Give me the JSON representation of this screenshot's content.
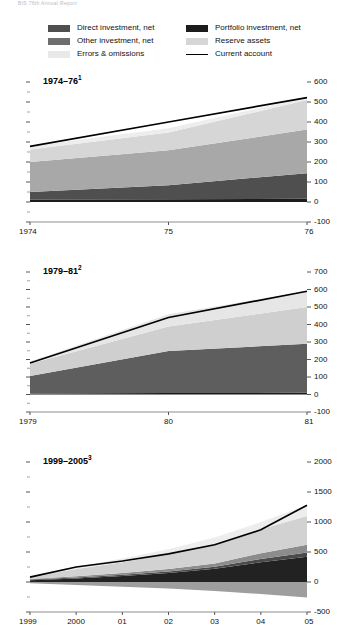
{
  "page": {
    "cut_off_header": "BIS 76th Annual Report"
  },
  "legend": {
    "columns": [
      {
        "items": [
          {
            "label": "Direct investment, net",
            "swatch": "#4f4f4f",
            "type": "area",
            "name": "legend-swatch-direct-investment"
          },
          {
            "label": "Other investment, net",
            "swatch": "#6e6e6e",
            "type": "area",
            "name": "legend-swatch-other-investment"
          },
          {
            "label": "Errors & omissions",
            "swatch": "#e9e9e9",
            "type": "area",
            "name": "legend-swatch-errors-omissions"
          }
        ]
      },
      {
        "items": [
          {
            "label": "Portfolio investment, net",
            "swatch": "#1c1c1c",
            "type": "area",
            "name": "legend-swatch-portfolio-investment"
          },
          {
            "label": "Reserve assets",
            "swatch": "#d6d6d6",
            "type": "area",
            "name": "legend-swatch-reserve-assets"
          },
          {
            "label": "Current account",
            "swatch": "#000000",
            "type": "line",
            "name": "legend-swatch-current-account"
          }
        ]
      }
    ]
  },
  "chart_data": [
    {
      "type": "area",
      "stacked": true,
      "title": "1974–76",
      "title_superscript": "1",
      "xlabel": "",
      "ylabel": "",
      "x": [
        1974,
        1975,
        1976
      ],
      "xtick_labels": [
        "1974",
        "75",
        "76"
      ],
      "ylim": [
        -100,
        600
      ],
      "yticks": [
        -100,
        0,
        100,
        200,
        300,
        400,
        500,
        600
      ],
      "ytick_labels": [
        "-100",
        "0",
        "100",
        "200",
        "300",
        "400",
        "500",
        "600"
      ],
      "grid": false,
      "legend_position": "top",
      "series": [
        {
          "name": "Portfolio investment, net",
          "color": "#1c1c1c",
          "values": [
            12,
            14,
            16
          ]
        },
        {
          "name": "Direct investment, net",
          "color": "#4f4f4f",
          "values": [
            38,
            70,
            128
          ]
        },
        {
          "name": "Other investment, net",
          "color": "#a8a8a8",
          "values": [
            150,
            175,
            218
          ]
        },
        {
          "name": "Reserve assets",
          "color": "#d6d6d6",
          "values": [
            62,
            88,
            148
          ]
        },
        {
          "name": "Errors & omissions",
          "color": "#ededed",
          "values": [
            18,
            22,
            12
          ]
        }
      ],
      "line_series": {
        "name": "Current account",
        "color": "#000000",
        "values": [
          278,
          400,
          522
        ]
      }
    },
    {
      "type": "area",
      "stacked": true,
      "title": "1979–81",
      "title_superscript": "2",
      "xlabel": "",
      "ylabel": "",
      "x": [
        1979,
        1980,
        1981
      ],
      "xtick_labels": [
        "1979",
        "80",
        "81"
      ],
      "ylim": [
        -100,
        700
      ],
      "yticks": [
        -100,
        0,
        100,
        200,
        300,
        400,
        500,
        600,
        700
      ],
      "ytick_labels": [
        "-100",
        "0",
        "100",
        "200",
        "300",
        "400",
        "500",
        "600",
        "700"
      ],
      "grid": false,
      "legend_position": "top",
      "series": [
        {
          "name": "Portfolio investment, net",
          "color": "#1c1c1c",
          "values": [
            6,
            8,
            10
          ]
        },
        {
          "name": "Direct investment, net",
          "color": "#4f4f4f",
          "values": [
            0,
            0,
            0
          ]
        },
        {
          "name": "Other investment, net",
          "color": "#5e5e5e",
          "values": [
            100,
            240,
            280
          ]
        },
        {
          "name": "Reserve assets",
          "color": "#cfcfcf",
          "values": [
            70,
            140,
            210
          ]
        },
        {
          "name": "Errors & omissions",
          "color": "#e6e6e6",
          "values": [
            12,
            70,
            90
          ]
        }
      ],
      "line_series": {
        "name": "Current account",
        "color": "#000000",
        "values": [
          180,
          440,
          590
        ]
      }
    },
    {
      "type": "area",
      "stacked": true,
      "title": "1999–2005",
      "title_superscript": "3",
      "xlabel": "",
      "ylabel": "",
      "x": [
        1999,
        2000,
        2001,
        2002,
        2003,
        2004,
        2005
      ],
      "xtick_labels": [
        "1999",
        "2000",
        "01",
        "02",
        "03",
        "04",
        "05"
      ],
      "ylim": [
        -500,
        2000
      ],
      "yticks": [
        -500,
        0,
        500,
        1000,
        1500,
        2000
      ],
      "ytick_labels": [
        "-500",
        "0",
        "500",
        "1000",
        "1500",
        "2000"
      ],
      "grid": false,
      "legend_position": "top",
      "series": [
        {
          "name": "Portfolio investment, net",
          "color": "#222222",
          "values": [
            30,
            60,
            100,
            150,
            220,
            330,
            420
          ]
        },
        {
          "name": "Direct investment, net",
          "color": "#4a4a4a",
          "values": [
            10,
            15,
            20,
            25,
            35,
            55,
            70
          ]
        },
        {
          "name": "Other investment, net",
          "color": "#8c8c8c",
          "values": [
            10,
            20,
            30,
            40,
            55,
            95,
            130
          ]
        },
        {
          "name": "Reserve assets",
          "color": "#d2d2d2",
          "values": [
            40,
            120,
            180,
            250,
            330,
            400,
            480
          ]
        },
        {
          "name": "Errors & omissions",
          "color": "#ededed",
          "values": [
            20,
            40,
            60,
            80,
            100,
            120,
            180
          ]
        },
        {
          "name": "Below-axis component",
          "color": "#9e9e9e",
          "values": [
            -20,
            -50,
            -80,
            -110,
            -150,
            -200,
            -260
          ]
        }
      ],
      "line_series": {
        "name": "Current account",
        "color": "#000000",
        "values": [
          80,
          250,
          350,
          470,
          620,
          870,
          1280
        ]
      }
    }
  ]
}
